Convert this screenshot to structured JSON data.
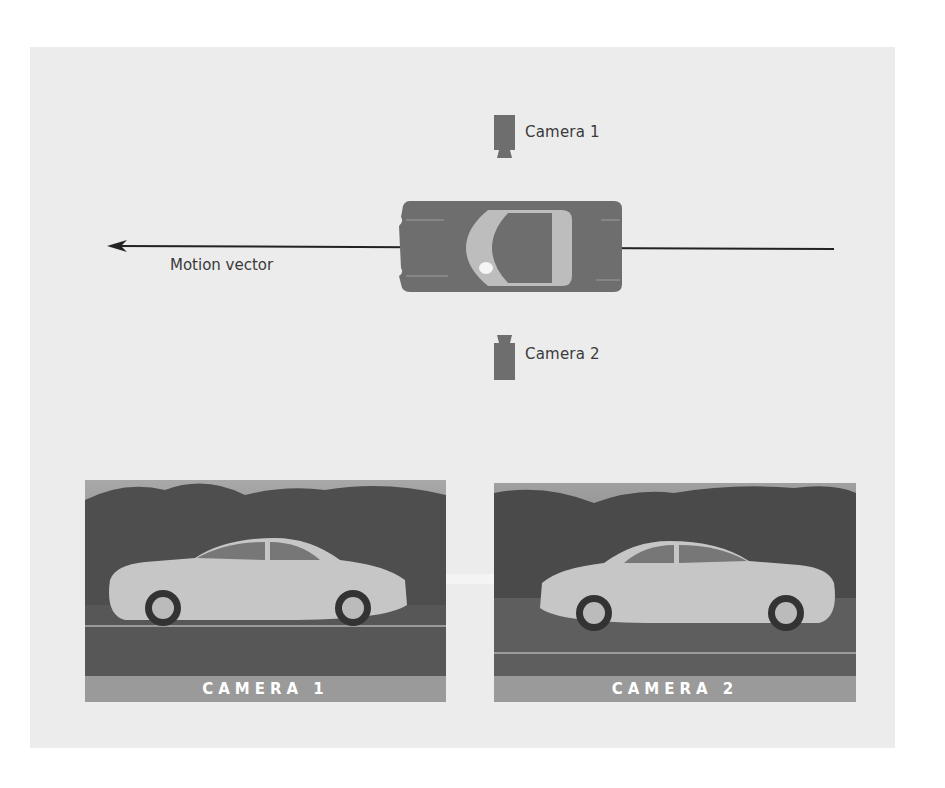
{
  "diagram": {
    "top_view": {
      "camera1_label": "Camera 1",
      "camera2_label": "Camera 2",
      "motion_label": "Motion vector",
      "arrow_direction": "left",
      "car_color": "#6e6e6e",
      "glass_color": "#bdbdbd"
    },
    "photos": [
      {
        "label": "CAMERA 1",
        "car_facing": "right"
      },
      {
        "label": "CAMERA 2",
        "car_facing": "left"
      }
    ],
    "transition_arrow": "right",
    "colors": {
      "panel_bg": "#ececec",
      "icon_gray": "#6e6e6e",
      "label_band": "#9a9a9a",
      "arrow_line": "#222222"
    }
  }
}
